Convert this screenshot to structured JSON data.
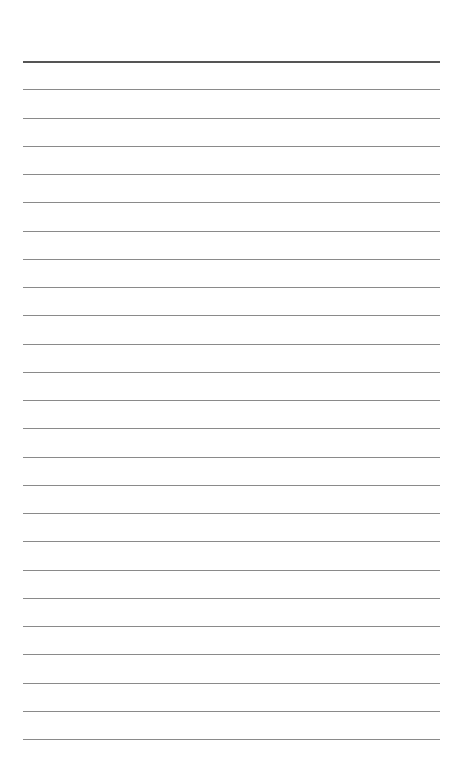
{
  "sheet": {
    "line_count": 25,
    "first_line_y": 61,
    "line_spacing": 28.25,
    "column_split_x": 297,
    "header_line_emphasized": true,
    "line_color": "#8a8a8a",
    "header_line_color": "#555555"
  }
}
